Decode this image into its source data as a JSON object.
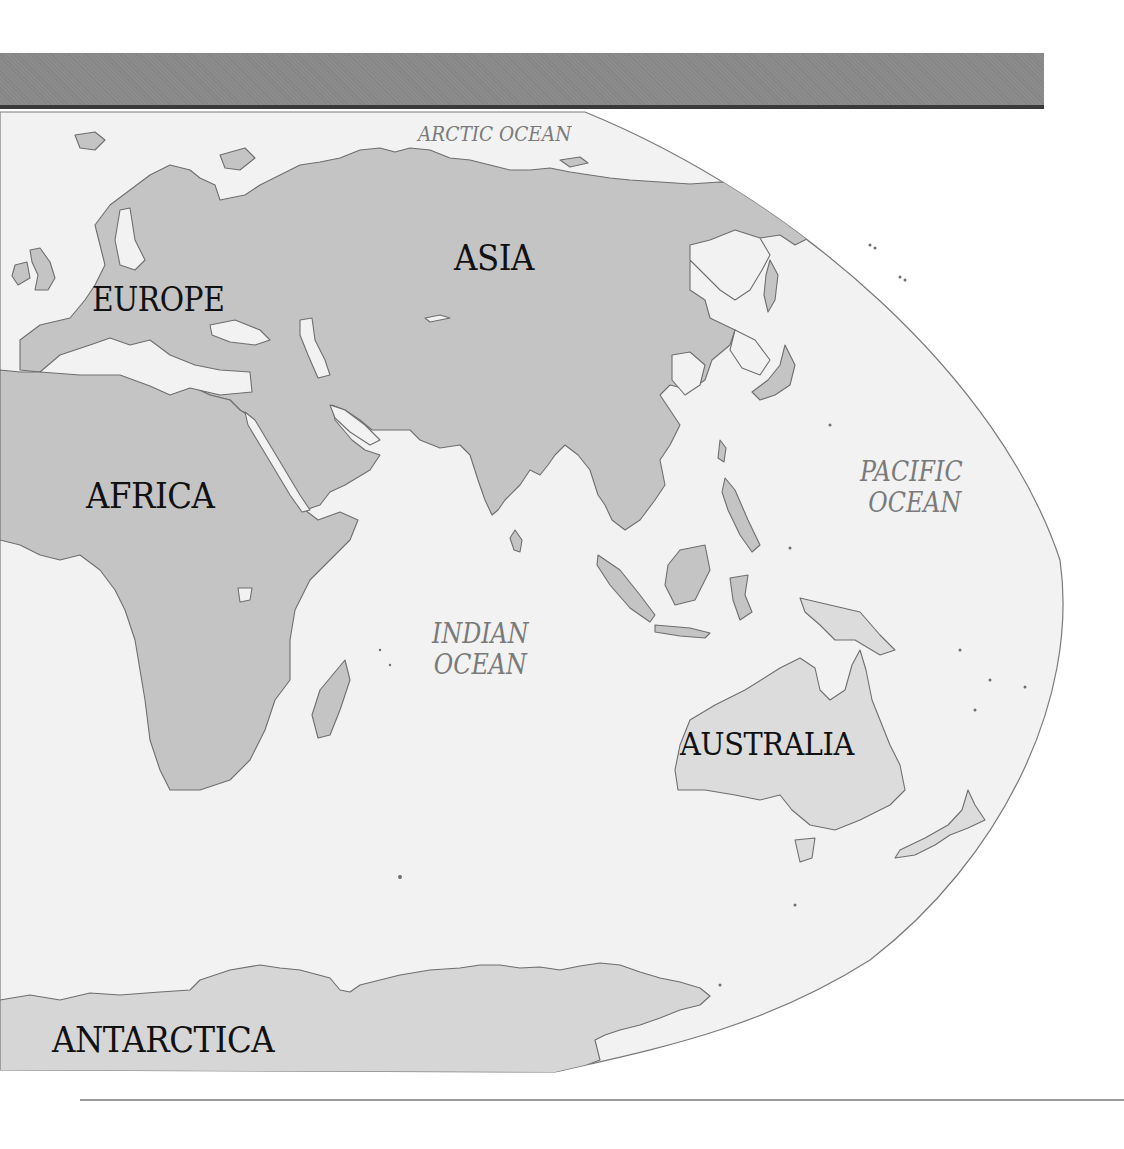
{
  "map": {
    "type": "world-map-eastern-hemisphere",
    "colors": {
      "land": "#c4c4c4",
      "australia_land": "#dcdcdc",
      "antarctica_land": "#d6d6d6",
      "ocean": "#f2f2f2",
      "outline": "#6e6e6e",
      "header_bar": "#8c8c8c",
      "continent_label": "#111111",
      "ocean_label": "#7a7a7a"
    },
    "continents": [
      {
        "id": "asia",
        "label": "ASIA"
      },
      {
        "id": "europe",
        "label": "EUROPE"
      },
      {
        "id": "africa",
        "label": "AFRICA"
      },
      {
        "id": "australia",
        "label": "AUSTRALIA"
      },
      {
        "id": "antarctica",
        "label": "ANTARCTICA"
      }
    ],
    "oceans": [
      {
        "id": "arctic",
        "label": "ARCTIC OCEAN"
      },
      {
        "id": "indian",
        "line1": "INDIAN",
        "line2": "OCEAN"
      },
      {
        "id": "pacific",
        "line1": "PACIFIC",
        "line2": "OCEAN"
      }
    ]
  }
}
